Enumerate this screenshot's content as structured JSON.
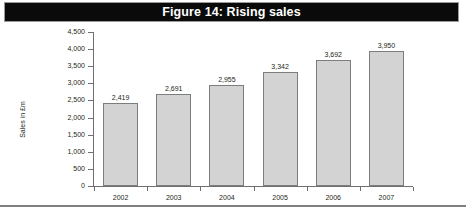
{
  "figure": {
    "title": "Figure 14: Rising sales"
  },
  "chart_data": {
    "type": "bar",
    "title": "Figure 14: Rising sales",
    "xlabel": "",
    "ylabel": "Sales in £m",
    "categories": [
      "2002",
      "2003",
      "2004",
      "2005",
      "2006",
      "2007"
    ],
    "values": [
      2419,
      2691,
      2955,
      3342,
      3692,
      3950
    ],
    "value_labels": [
      "2,419",
      "2,691",
      "2,955",
      "3,342",
      "3,692",
      "3,950"
    ],
    "ylim": [
      0,
      4500
    ],
    "ytick_values": [
      0,
      500,
      1000,
      1500,
      2000,
      2500,
      3000,
      3500,
      4000,
      4500
    ],
    "ytick_labels": [
      "0",
      "500",
      "1,000",
      "1,500",
      "2,000",
      "2,500",
      "3,000",
      "3,500",
      "4,000",
      "4,500"
    ],
    "grid": false,
    "legend": false,
    "series": [
      {
        "name": "Sales",
        "values": [
          2419,
          2691,
          2955,
          3342,
          3692,
          3950
        ]
      }
    ]
  },
  "colors": {
    "banner_background": "#0a0a0a",
    "banner_text": "#ffffff",
    "bar_fill": "#d3d3d3",
    "bar_border": "#7d7d7d",
    "axis": "#6f6f6f",
    "rule": "#808080"
  }
}
